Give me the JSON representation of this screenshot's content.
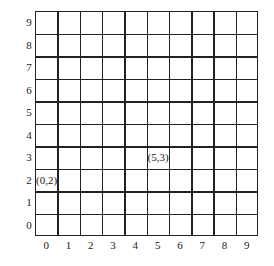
{
  "diagram": {
    "type": "coordinate-grid",
    "columns": 10,
    "rows": 10,
    "x_axis_labels": [
      "0",
      "1",
      "2",
      "3",
      "4",
      "5",
      "6",
      "7",
      "8",
      "9"
    ],
    "y_axis_labels": [
      "0",
      "1",
      "2",
      "3",
      "4",
      "5",
      "6",
      "7",
      "8",
      "9"
    ],
    "points": [
      {
        "label": "(0,2)",
        "x": 0,
        "y": 2
      },
      {
        "label": "(5,3)",
        "x": 5,
        "y": 3
      }
    ],
    "line_color": "#222222",
    "background": "#ffffff"
  }
}
